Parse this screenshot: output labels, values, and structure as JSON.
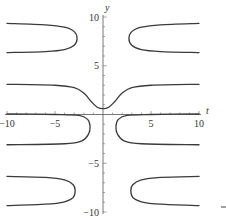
{
  "chart_data": {
    "type": "line",
    "title": "",
    "xlabel": "t",
    "ylabel": "y",
    "xlim": [
      -10,
      10
    ],
    "ylim": [
      -10,
      10
    ],
    "grid": false,
    "legend": null,
    "x_ticks": [
      -10,
      -5,
      5,
      10
    ],
    "y_ticks": [
      10,
      5,
      -5,
      -10
    ],
    "x_tick_labels": [
      "-10",
      "-5",
      "5",
      "10"
    ],
    "y_tick_labels": [
      "10",
      "5",
      "-5",
      "-10"
    ],
    "line_color": "#3a3a3a",
    "series": [
      {
        "name": "upper-left-loop",
        "points": [
          [
            -10,
            9.35
          ],
          [
            -6,
            9.2
          ],
          [
            -4,
            8.95
          ],
          [
            -3,
            8.5
          ],
          [
            -2.7,
            7.8
          ],
          [
            -3,
            7.1
          ],
          [
            -4,
            6.65
          ],
          [
            -6,
            6.45
          ],
          [
            -10,
            6.35
          ]
        ]
      },
      {
        "name": "upper-right-loop",
        "points": [
          [
            10,
            9.35
          ],
          [
            6,
            9.2
          ],
          [
            4,
            8.95
          ],
          [
            3,
            8.5
          ],
          [
            2.7,
            7.8
          ],
          [
            3,
            7.1
          ],
          [
            4,
            6.65
          ],
          [
            6,
            6.45
          ],
          [
            10,
            6.35
          ]
        ]
      },
      {
        "name": "central-curve",
        "points": [
          [
            -10,
            3.1
          ],
          [
            -5,
            3.0
          ],
          [
            -3,
            2.75
          ],
          [
            -2,
            2.2
          ],
          [
            -1.2,
            1.3
          ],
          [
            -0.6,
            0.75
          ],
          [
            0,
            0.6
          ],
          [
            0.6,
            0.75
          ],
          [
            1.2,
            1.3
          ],
          [
            2,
            2.2
          ],
          [
            3,
            2.75
          ],
          [
            5,
            3.0
          ],
          [
            10,
            3.1
          ]
        ]
      },
      {
        "name": "lower-left-loop",
        "points": [
          [
            -10,
            0.05
          ],
          [
            -5,
            0.0
          ],
          [
            -2.5,
            -0.1
          ],
          [
            -1.6,
            -0.5
          ],
          [
            -1.35,
            -1.2
          ],
          [
            -1.5,
            -2.0
          ],
          [
            -2.2,
            -2.7
          ],
          [
            -4,
            -3.0
          ],
          [
            -10,
            -3.1
          ]
        ]
      },
      {
        "name": "lower-right-loop",
        "points": [
          [
            10,
            0.05
          ],
          [
            5,
            0.0
          ],
          [
            2.5,
            -0.1
          ],
          [
            1.6,
            -0.5
          ],
          [
            1.35,
            -1.2
          ],
          [
            1.5,
            -2.0
          ],
          [
            2.2,
            -2.7
          ],
          [
            4,
            -3.0
          ],
          [
            10,
            -3.1
          ]
        ]
      },
      {
        "name": "bottom-left-loop",
        "points": [
          [
            -10,
            -6.35
          ],
          [
            -6,
            -6.45
          ],
          [
            -4,
            -6.7
          ],
          [
            -3.1,
            -7.2
          ],
          [
            -2.9,
            -7.8
          ],
          [
            -3.1,
            -8.5
          ],
          [
            -4,
            -8.95
          ],
          [
            -6,
            -9.2
          ],
          [
            -10,
            -9.35
          ]
        ]
      },
      {
        "name": "bottom-right-loop",
        "points": [
          [
            10,
            -6.35
          ],
          [
            6,
            -6.45
          ],
          [
            4,
            -6.7
          ],
          [
            3.1,
            -7.2
          ],
          [
            2.9,
            -7.8
          ],
          [
            3.1,
            -8.5
          ],
          [
            4,
            -8.95
          ],
          [
            6,
            -9.2
          ],
          [
            10,
            -9.35
          ]
        ]
      }
    ]
  }
}
